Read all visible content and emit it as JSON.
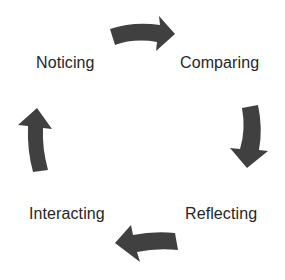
{
  "diagram": {
    "type": "cycle",
    "arrow_color": "#404040",
    "text_color": "#262626",
    "stages": [
      {
        "label": "Noticing"
      },
      {
        "label": "Comparing"
      },
      {
        "label": "Reflecting"
      },
      {
        "label": "Interacting"
      }
    ],
    "arrows": [
      {
        "from": "Noticing",
        "to": "Comparing",
        "direction": "right",
        "icon": "curved-arrow-right"
      },
      {
        "from": "Comparing",
        "to": "Reflecting",
        "direction": "down",
        "icon": "curved-arrow-down"
      },
      {
        "from": "Reflecting",
        "to": "Interacting",
        "direction": "left",
        "icon": "curved-arrow-left"
      },
      {
        "from": "Interacting",
        "to": "Noticing",
        "direction": "up",
        "icon": "curved-arrow-up"
      }
    ]
  }
}
